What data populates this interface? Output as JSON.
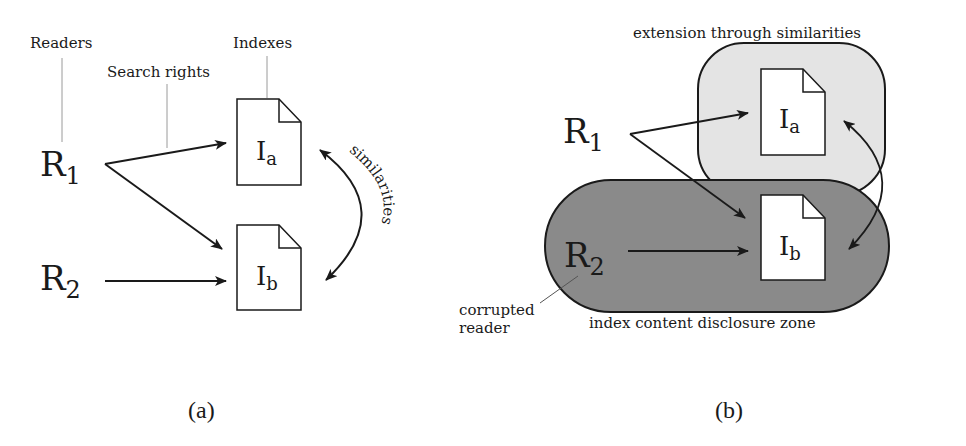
{
  "panel_a": {
    "caption": "(a)",
    "labels": {
      "readers": "Readers",
      "search_rights": "Search rights",
      "indexes": "Indexes",
      "similarities": "similarities"
    },
    "readers": [
      {
        "base": "R",
        "sub": "1"
      },
      {
        "base": "R",
        "sub": "2"
      }
    ],
    "indexes": [
      {
        "base": "I",
        "sub": "a"
      },
      {
        "base": "I",
        "sub": "b"
      }
    ]
  },
  "panel_b": {
    "caption": "(b)",
    "labels": {
      "extension_zone": "extension through similarities",
      "disclosure_zone": "index content disclosure zone",
      "corrupted_line1": "corrupted",
      "corrupted_line2": "reader"
    },
    "readers": [
      {
        "base": "R",
        "sub": "1"
      },
      {
        "base": "R",
        "sub": "2"
      }
    ],
    "indexes": [
      {
        "base": "I",
        "sub": "a"
      },
      {
        "base": "I",
        "sub": "b"
      }
    ],
    "colors": {
      "extension_fill": "#e4e4e4",
      "disclosure_fill": "#8a8a8a",
      "stroke": "#1a1a1a"
    }
  }
}
